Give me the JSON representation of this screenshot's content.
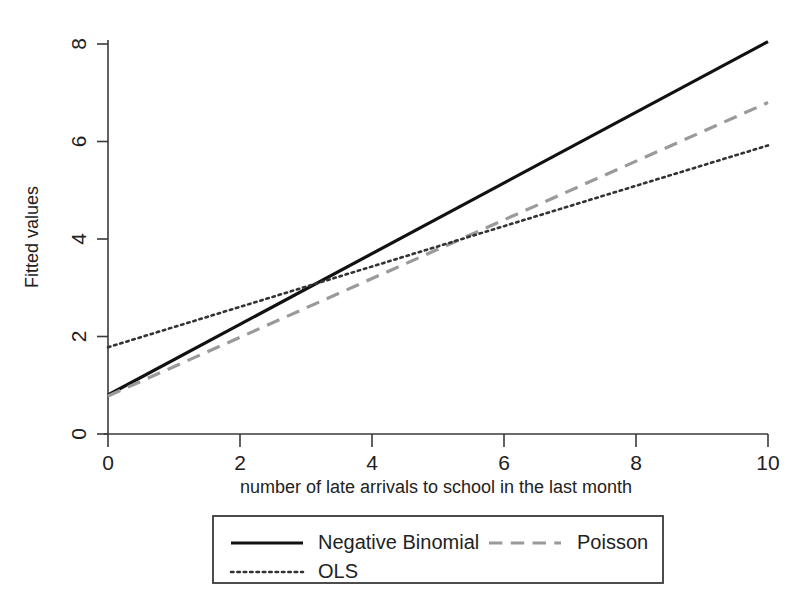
{
  "chart_data": {
    "type": "line",
    "title": "",
    "xlabel": "number of late arrivals to school in the last month",
    "ylabel": "Fitted values",
    "xlim": [
      0,
      10
    ],
    "ylim": [
      0,
      8.6
    ],
    "xticks": [
      "0",
      "2",
      "4",
      "6",
      "8",
      "10"
    ],
    "xtick_values": [
      0,
      2,
      4,
      6,
      8,
      10
    ],
    "yticks": [
      "0",
      "2",
      "4",
      "6",
      "8"
    ],
    "ytick_values": [
      0,
      2,
      4,
      6,
      8
    ],
    "grid": false,
    "legend_position": "below-center",
    "x": [
      0,
      10
    ],
    "series": [
      {
        "name": "Negative Binomial",
        "values": [
          0.8,
          8.05
        ],
        "style": "solid",
        "color": "#111111",
        "width": 3.2
      },
      {
        "name": "Poisson",
        "values": [
          0.78,
          6.8
        ],
        "style": "dashed",
        "color": "#9a9a9a",
        "width": 3.2
      },
      {
        "name": "OLS",
        "values": [
          1.78,
          5.92
        ],
        "style": "dotted",
        "color": "#333333",
        "width": 2.6
      }
    ]
  },
  "legend": {
    "entries": [
      {
        "label": "Negative Binomial"
      },
      {
        "label": "Poisson"
      },
      {
        "label": "OLS"
      }
    ]
  }
}
